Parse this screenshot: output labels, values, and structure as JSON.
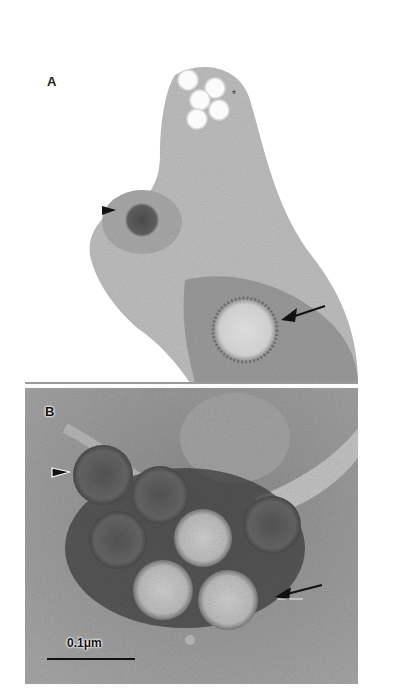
{
  "figure": {
    "panels": [
      {
        "id": "A",
        "label": "A",
        "annotations": {
          "asterisk": "*",
          "arrowhead": "arrowhead pointing to dark particle",
          "arrow": "arrow pointing to light particle"
        }
      },
      {
        "id": "B",
        "label": "B",
        "annotations": {
          "arrowhead": "arrowhead pointing to dark particle",
          "arrow": "arrow pointing to light particle"
        },
        "scale_bar": {
          "label": "0.1μm"
        }
      }
    ],
    "colors": {
      "background": "#ffffff",
      "panel_b_background": "#8e8e8e",
      "stain_dark": "#3a3a3a",
      "particle_light": "#c8c8c8",
      "particle_dark": "#5a5a5a"
    }
  }
}
